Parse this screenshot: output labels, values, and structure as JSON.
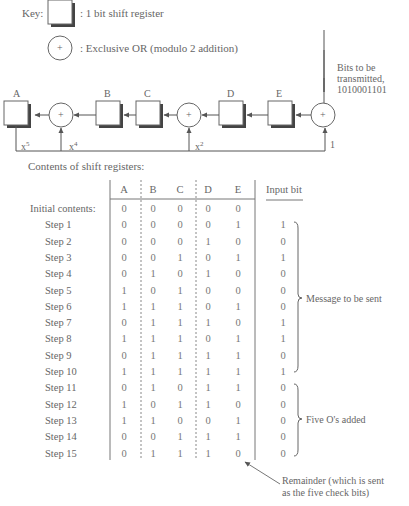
{
  "key": {
    "label": "Key:",
    "register_desc": ": 1 bit shift register",
    "xor_desc": ": Exclusive OR (modulo 2 addition)",
    "xor_symbol": "+"
  },
  "input_note": {
    "line1": "Bits to be",
    "line2": "transmitted,",
    "line3": "1010001101"
  },
  "circuit": {
    "registers": [
      "A",
      "B",
      "C",
      "D",
      "E"
    ],
    "taps": {
      "x5": "x",
      "x5_exp": "5",
      "x4": "x",
      "x4_exp": "4",
      "x2": "x",
      "x2_exp": "2",
      "one": "1"
    },
    "xor_symbol": "+"
  },
  "table_title": "Contents of shift registers:",
  "table": {
    "columns": [
      "A",
      "B",
      "C",
      "D",
      "E"
    ],
    "input_header": "Input bit",
    "rows": [
      {
        "label": "Initial contents:",
        "values": [
          "0",
          "0",
          "0",
          "0",
          "0"
        ],
        "input": ""
      },
      {
        "label": "Step  1",
        "values": [
          "0",
          "0",
          "0",
          "0",
          "1"
        ],
        "input": "1"
      },
      {
        "label": "Step  2",
        "values": [
          "0",
          "0",
          "0",
          "1",
          "0"
        ],
        "input": "0"
      },
      {
        "label": "Step  3",
        "values": [
          "0",
          "0",
          "1",
          "0",
          "1"
        ],
        "input": "1"
      },
      {
        "label": "Step  4",
        "values": [
          "0",
          "1",
          "0",
          "1",
          "0"
        ],
        "input": "0"
      },
      {
        "label": "Step  5",
        "values": [
          "1",
          "0",
          "1",
          "0",
          "0"
        ],
        "input": "0"
      },
      {
        "label": "Step  6",
        "values": [
          "1",
          "1",
          "1",
          "0",
          "1"
        ],
        "input": "0"
      },
      {
        "label": "Step  7",
        "values": [
          "0",
          "1",
          "1",
          "1",
          "0"
        ],
        "input": "1"
      },
      {
        "label": "Step  8",
        "values": [
          "1",
          "1",
          "1",
          "0",
          "1"
        ],
        "input": "1"
      },
      {
        "label": "Step  9",
        "values": [
          "0",
          "1",
          "1",
          "1",
          "1"
        ],
        "input": "0"
      },
      {
        "label": "Step 10",
        "values": [
          "1",
          "1",
          "1",
          "1",
          "1"
        ],
        "input": "1"
      },
      {
        "label": "Step 11",
        "values": [
          "0",
          "1",
          "0",
          "1",
          "1"
        ],
        "input": "0"
      },
      {
        "label": "Step 12",
        "values": [
          "1",
          "0",
          "1",
          "1",
          "0"
        ],
        "input": "0"
      },
      {
        "label": "Step 13",
        "values": [
          "1",
          "1",
          "0",
          "0",
          "1"
        ],
        "input": "0"
      },
      {
        "label": "Step 14",
        "values": [
          "0",
          "0",
          "1",
          "1",
          "1"
        ],
        "input": "0"
      },
      {
        "label": "Step 15",
        "values": [
          "0",
          "1",
          "1",
          "1",
          "0"
        ],
        "input": "0"
      }
    ]
  },
  "annotations": {
    "message": "Message to be sent",
    "zeros": "Five O's added",
    "remainder_line1": "Remainder (which is sent",
    "remainder_line2": "as the five check bits)"
  }
}
